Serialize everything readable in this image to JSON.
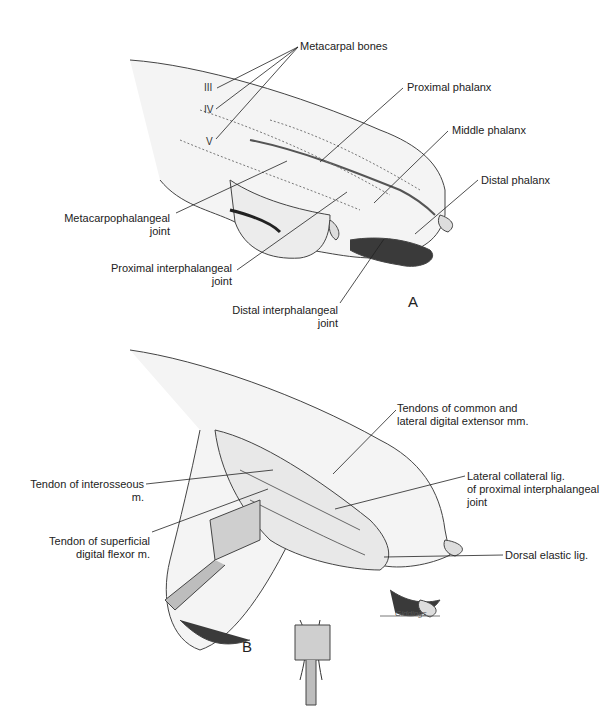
{
  "panel_a": {
    "letter": "A",
    "labels": {
      "metacarpal_bones": "Metacarpal bones",
      "roman_iii": "III",
      "roman_iv": "IV",
      "roman_v": "V",
      "proximal_phalanx": "Proximal phalanx",
      "middle_phalanx": "Middle phalanx",
      "distal_phalanx": "Distal phalanx",
      "mcp_joint_1": "Metacarpophalangeal",
      "mcp_joint_2": "joint",
      "pip_joint_1": "Proximal interphalangeal",
      "pip_joint_2": "joint",
      "dip_joint_1": "Distal interphalangeal",
      "dip_joint_2": "joint"
    }
  },
  "panel_b": {
    "letter": "B",
    "labels": {
      "extensor_1": "Tendons of common and",
      "extensor_2": "lateral digital extensor mm.",
      "interosseous_1": "Tendon of interosseous",
      "interosseous_2": "m.",
      "collateral_1": "Lateral collateral lig.",
      "collateral_2": "of proximal interphalangeal",
      "collateral_3": "joint",
      "sdf_1": "Tendon of superficial",
      "sdf_2": "digital flexor m.",
      "dorsal_elastic": "Dorsal elastic lig."
    },
    "signature": "Giddings"
  }
}
